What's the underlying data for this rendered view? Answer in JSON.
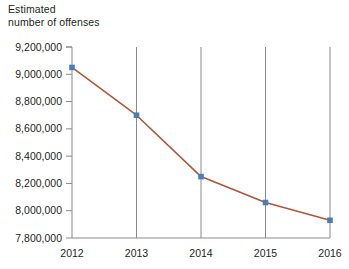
{
  "chart_data": {
    "type": "line",
    "title": "Estimated\nnumber of offenses",
    "xlabel": "",
    "ylabel": "",
    "categories": [
      "2012",
      "2013",
      "2014",
      "2015",
      "2016"
    ],
    "x": [
      2012,
      2013,
      2014,
      2015,
      2016
    ],
    "values": [
      9050000,
      8700000,
      8250000,
      8060000,
      7930000
    ],
    "series": [
      {
        "name": "Estimated number of offenses",
        "values": [
          9050000,
          8700000,
          8250000,
          8060000,
          7930000
        ]
      }
    ],
    "ylim": [
      7800000,
      9200000
    ],
    "ytick_values": [
      7800000,
      8000000,
      8200000,
      8400000,
      8600000,
      8800000,
      9000000,
      9200000
    ],
    "ytick_labels": [
      "7,800,000",
      "8,000,000",
      "8,200,000",
      "8,400,000",
      "8,600,000",
      "8,800,000",
      "9,000,000",
      "9,200,000"
    ],
    "xtick_labels": [
      "2012",
      "2013",
      "2014",
      "2015",
      "2016"
    ],
    "grid": "vertical-only",
    "legend": "none",
    "line_color": "#b0563a",
    "marker_color": "#4a7ebb",
    "marker_shape": "square",
    "axis_color": "#8a8a8a",
    "text_color": "#231f20"
  }
}
